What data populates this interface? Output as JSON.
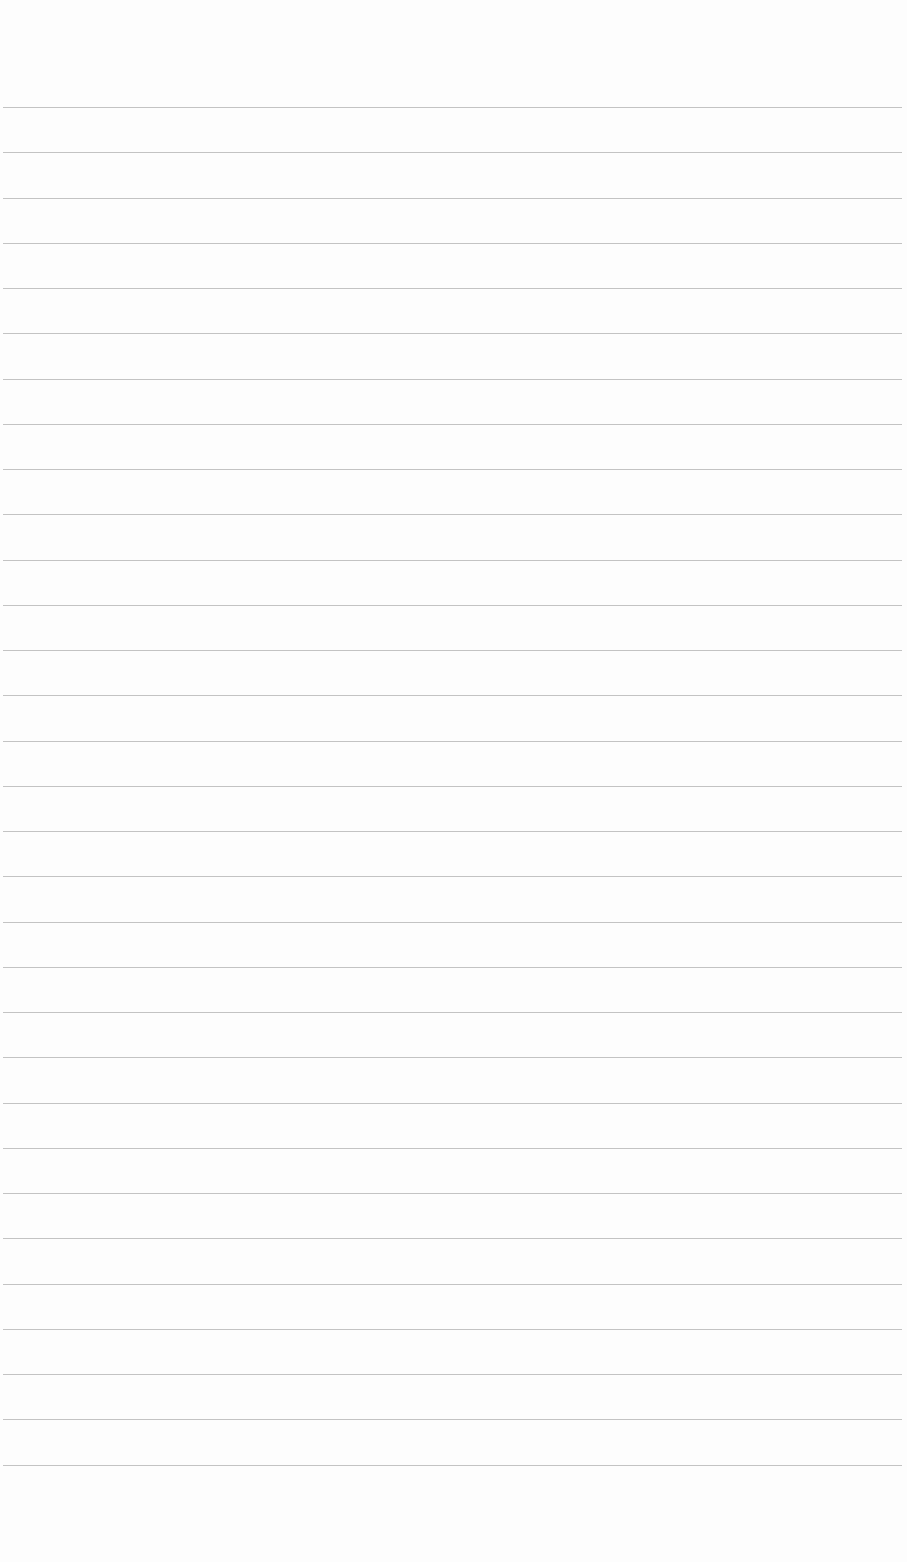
{
  "page": {
    "type": "lined-paper",
    "background_color": "#fdfdfd",
    "rule_color": "#b9b9b9",
    "rule_count": 31,
    "first_rule_y": 107,
    "rule_spacing": 45.25,
    "rule_left": 3,
    "rule_right": 902,
    "text": ""
  }
}
